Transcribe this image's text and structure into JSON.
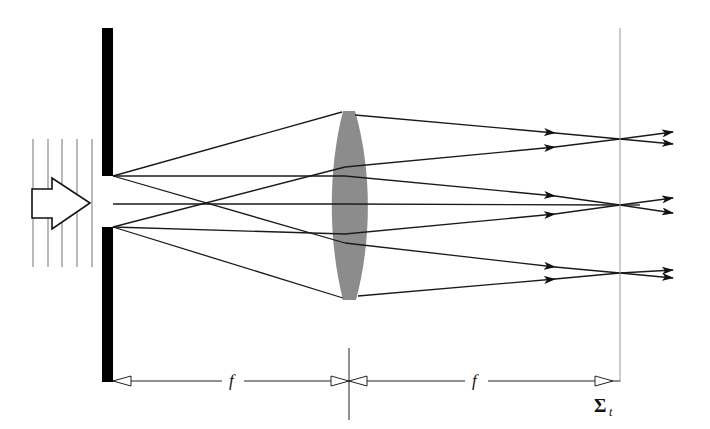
{
  "diagram": {
    "labels": {
      "focal_length_left": "f",
      "focal_length_right": "f",
      "plane_symbol": "Σ",
      "plane_subscript": "t"
    },
    "colors": {
      "screen": "#000000",
      "lens": "#8c8c8c",
      "rays": "#1a1a1a",
      "wavefronts": "#a8a8a8",
      "plane_line": "#9a9a9a"
    },
    "elements": {
      "incident_wavefronts": 5,
      "slit_screen": "opaque screen with single slit",
      "lens": "converging lens",
      "focal_plane": "observation plane Σt",
      "focus_points": 3
    }
  }
}
